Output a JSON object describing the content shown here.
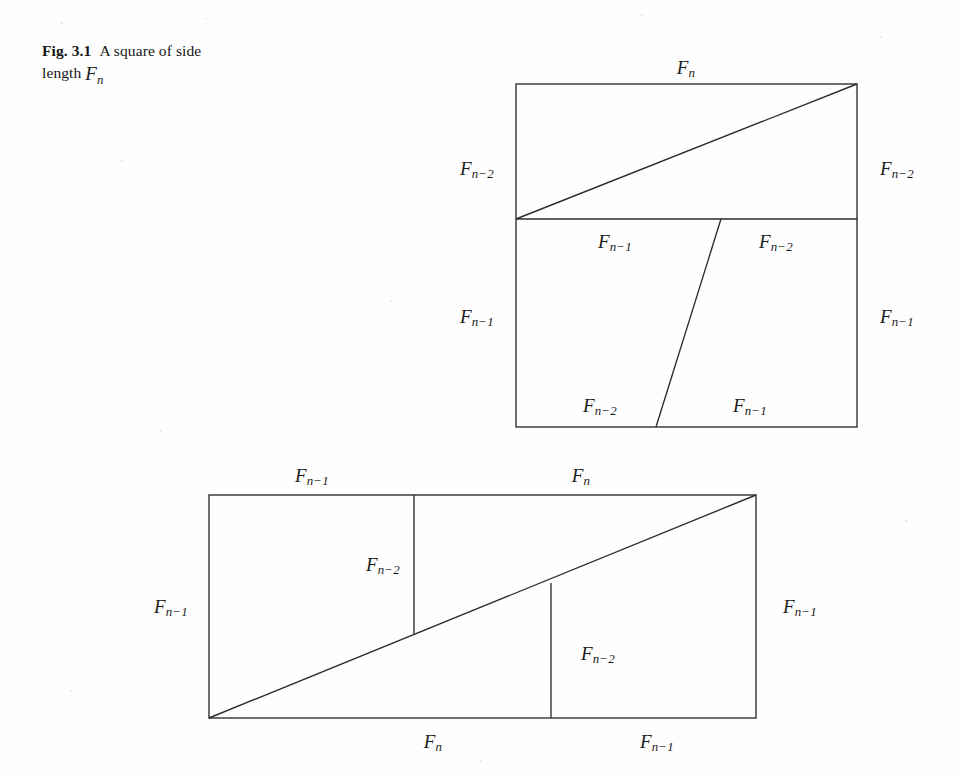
{
  "caption": {
    "label": "Fig. 3.1",
    "text": "A square of side length Fn",
    "lead": "Fig. 3.1",
    "rest": "A square of side",
    "line2_prefix": "length",
    "line2_math_base": "F",
    "line2_math_sub": "n"
  },
  "math": {
    "base": "F",
    "sub_n": "n",
    "sub_n1": "n−1",
    "sub_n2": "n−2"
  },
  "figures": [
    {
      "name": "top-square",
      "description": "A square of side length Fn subdivided into an upper band of height Fn-2 with a diagonal, and a lower band of height Fn-1 split by a slanted line",
      "geometry": {
        "x": 516,
        "y": 84,
        "width": 341,
        "height": 343,
        "divider_y": 219,
        "diagonal": {
          "x1": 516,
          "y1": 219,
          "x2": 857,
          "y2": 84
        },
        "slant": {
          "x1": 721,
          "y1": 219,
          "x2": 656,
          "y2": 427
        }
      },
      "labels": [
        {
          "id": "top",
          "text_base": "F",
          "text_sub": "n",
          "x": 686,
          "y": 69
        },
        {
          "id": "upper-left",
          "text_base": "F",
          "text_sub": "n−2",
          "x": 477,
          "y": 170
        },
        {
          "id": "upper-right",
          "text_base": "F",
          "text_sub": "n−2",
          "x": 897,
          "y": 170
        },
        {
          "id": "mid-left",
          "text_base": "F",
          "text_sub": "n−1",
          "x": 615,
          "y": 243
        },
        {
          "id": "mid-right",
          "text_base": "F",
          "text_sub": "n−2",
          "x": 776,
          "y": 243
        },
        {
          "id": "lower-left",
          "text_base": "F",
          "text_sub": "n−1",
          "x": 477,
          "y": 318
        },
        {
          "id": "lower-right",
          "text_base": "F",
          "text_sub": "n−1",
          "x": 897,
          "y": 318
        },
        {
          "id": "bottom-left",
          "text_base": "F",
          "text_sub": "n−2",
          "x": 600,
          "y": 407
        },
        {
          "id": "bottom-right",
          "text_base": "F",
          "text_sub": "n−1",
          "x": 750,
          "y": 407
        }
      ]
    },
    {
      "name": "bottom-rectangle",
      "description": "A rectangle of width Fn+Fn-1 and height Fn-1 with a diagonal from bottom-left to top-right and two vertical segments of length Fn-2",
      "geometry": {
        "x": 209,
        "y": 495,
        "width": 547,
        "height": 223,
        "diagonal": {
          "x1": 209,
          "y1": 718,
          "x2": 756,
          "y2": 495
        },
        "vertical_left": {
          "x": 414,
          "y1": 495,
          "y2": 634
        },
        "vertical_right": {
          "x": 551,
          "y1": 583,
          "y2": 718
        }
      },
      "labels": [
        {
          "id": "top-left",
          "text_base": "F",
          "text_sub": "n−1",
          "x": 312,
          "y": 477
        },
        {
          "id": "top-right",
          "text_base": "F",
          "text_sub": "n",
          "x": 581,
          "y": 477
        },
        {
          "id": "side-left",
          "text_base": "F",
          "text_sub": "n−1",
          "x": 171,
          "y": 608
        },
        {
          "id": "side-right",
          "text_base": "F",
          "text_sub": "n−1",
          "x": 800,
          "y": 608
        },
        {
          "id": "inner-upper",
          "text_base": "F",
          "text_sub": "n−2",
          "x": 383,
          "y": 566
        },
        {
          "id": "inner-lower",
          "text_base": "F",
          "text_sub": "n−2",
          "x": 598,
          "y": 655
        },
        {
          "id": "bottom-left",
          "text_base": "F",
          "text_sub": "n",
          "x": 433,
          "y": 743
        },
        {
          "id": "bottom-right",
          "text_base": "F",
          "text_sub": "n−1",
          "x": 657,
          "y": 743
        }
      ]
    }
  ],
  "colors": {
    "ink": "#1a1a1a",
    "stroke": "#2a2a2a",
    "paper": "#fefefe"
  }
}
